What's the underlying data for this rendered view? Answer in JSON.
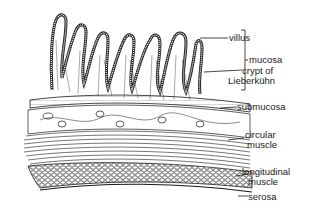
{
  "diagram": {
    "labels": {
      "villus": "villus",
      "mucosa": "mucosa",
      "crypt_line1": "crypt of",
      "crypt_line2": "Lieberkühn",
      "submucosa": "submucosa",
      "circular_line1": "circular",
      "circular_line2": "muscle",
      "longitudinal_line1": "longitudinal",
      "longitudinal_line2": "muscle",
      "serosa": "serosa"
    },
    "layers_top_to_bottom": [
      "villus",
      "crypt of Lieberkühn",
      "submucosa",
      "circular muscle",
      "longitudinal muscle",
      "serosa"
    ],
    "grouping": {
      "bracket": "mucosa",
      "includes": [
        "villus",
        "crypt of Lieberkühn"
      ]
    },
    "colors": {
      "ink": "#1a1a1a",
      "background": "#ffffff"
    }
  }
}
